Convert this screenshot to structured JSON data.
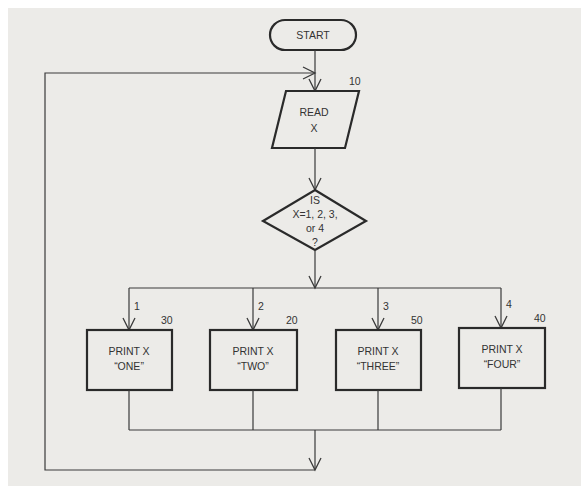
{
  "flowchart": {
    "start": {
      "label": "START"
    },
    "read": {
      "lines": [
        "READ",
        "X"
      ],
      "step_number": "10"
    },
    "decision": {
      "lines": [
        "IS",
        "X=1, 2, 3,",
        "or 4",
        "?"
      ]
    },
    "branches": [
      {
        "branch_label": "1",
        "step_number": "30",
        "lines": [
          "PRINT X",
          "“ONE”"
        ]
      },
      {
        "branch_label": "2",
        "step_number": "20",
        "lines": [
          "PRINT X",
          "“TWO”"
        ]
      },
      {
        "branch_label": "3",
        "step_number": "50",
        "lines": [
          "PRINT X",
          "“THREE”"
        ]
      },
      {
        "branch_label": "4",
        "step_number": "40",
        "lines": [
          "PRINT X",
          "“FOUR”"
        ]
      }
    ]
  }
}
